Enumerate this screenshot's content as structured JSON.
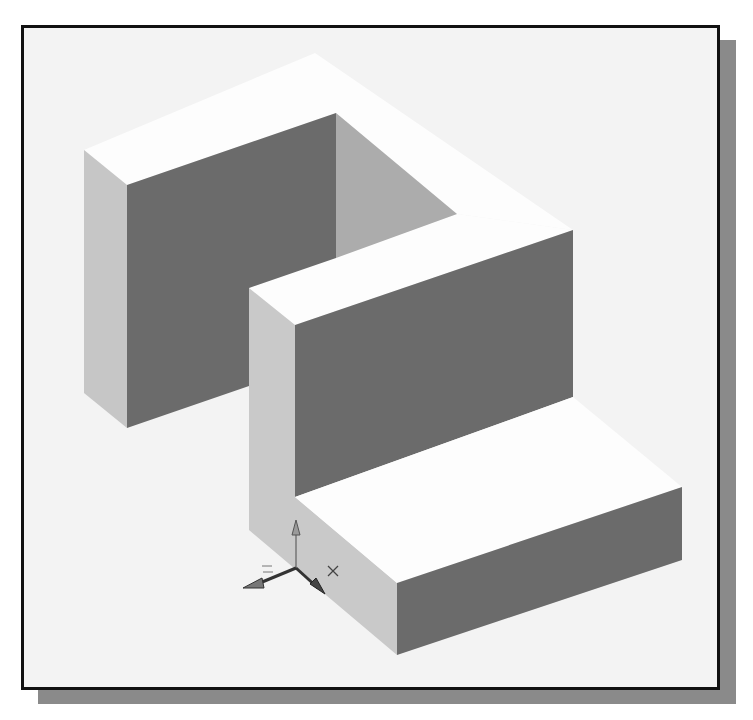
{
  "figure": {
    "colors": {
      "background": "#f3f3f3",
      "frame_border": "#111111",
      "drop_shadow": "#8a8a8a",
      "top_face": "#fdfdfd",
      "front_face_dark": "#6b6b6b",
      "side_face_light": "#c9c9c9",
      "inner_face_mid": "#a9a9a9"
    }
  },
  "ucs_icon": {
    "axes": [
      "X",
      "Y",
      "Z"
    ],
    "x_label": "X",
    "z_label": "Z"
  }
}
